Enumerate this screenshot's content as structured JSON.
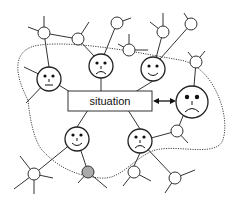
{
  "diagram": {
    "type": "network-with-faces",
    "center_label": "situation",
    "colors": {
      "stroke": "#333333",
      "highlight_node_fill": "#aaaaaa",
      "background": "#ffffff"
    },
    "faces": [
      {
        "id": "face-left",
        "expression": "neutral"
      },
      {
        "id": "face-top-middle",
        "expression": "sad"
      },
      {
        "id": "face-top-right",
        "expression": "happy"
      },
      {
        "id": "face-large-right",
        "expression": "sad"
      },
      {
        "id": "face-bottom-left",
        "expression": "happy"
      },
      {
        "id": "face-bottom-middle",
        "expression": "sad"
      }
    ],
    "arrow": {
      "from": "situation",
      "to": "face-large-right",
      "type": "bidirectional"
    },
    "boundary": {
      "style": "dotted",
      "encloses": "faces near the situation"
    },
    "highlighted_node": "gray node below bottom-left face"
  }
}
